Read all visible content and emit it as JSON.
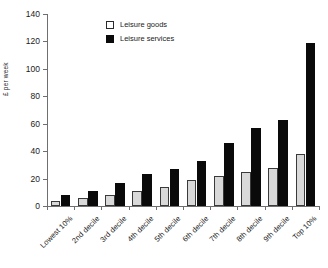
{
  "chart_data": {
    "type": "bar",
    "title": "",
    "xlabel": "",
    "ylabel": "£ per week",
    "ylim": [
      0,
      140
    ],
    "ytick_values": [
      0,
      20,
      40,
      60,
      80,
      100,
      120,
      140
    ],
    "ytick_labels": [
      "0",
      "20",
      "40",
      "60",
      "80",
      "100",
      "120",
      "140"
    ],
    "grid": false,
    "legend_position": "upper-left-inside",
    "categories": [
      "Lowest 10%",
      "2nd decile",
      "3rd decile",
      "4th decile",
      "5th decile",
      "6th decile",
      "7th decile",
      "8th decile",
      "9th decile",
      "Top 10%"
    ],
    "series": [
      {
        "name": "Leisure goods",
        "color": "#d9d9d9",
        "edge_color": "#3a3a3a",
        "values": [
          4,
          6,
          8,
          11,
          14,
          19,
          22,
          25,
          28,
          38
        ]
      },
      {
        "name": "Leisure services",
        "color": "#0a0a0a",
        "edge_color": "#0a0a0a",
        "values": [
          8,
          11,
          17,
          23,
          27,
          33,
          46,
          57,
          63,
          119
        ]
      }
    ]
  }
}
